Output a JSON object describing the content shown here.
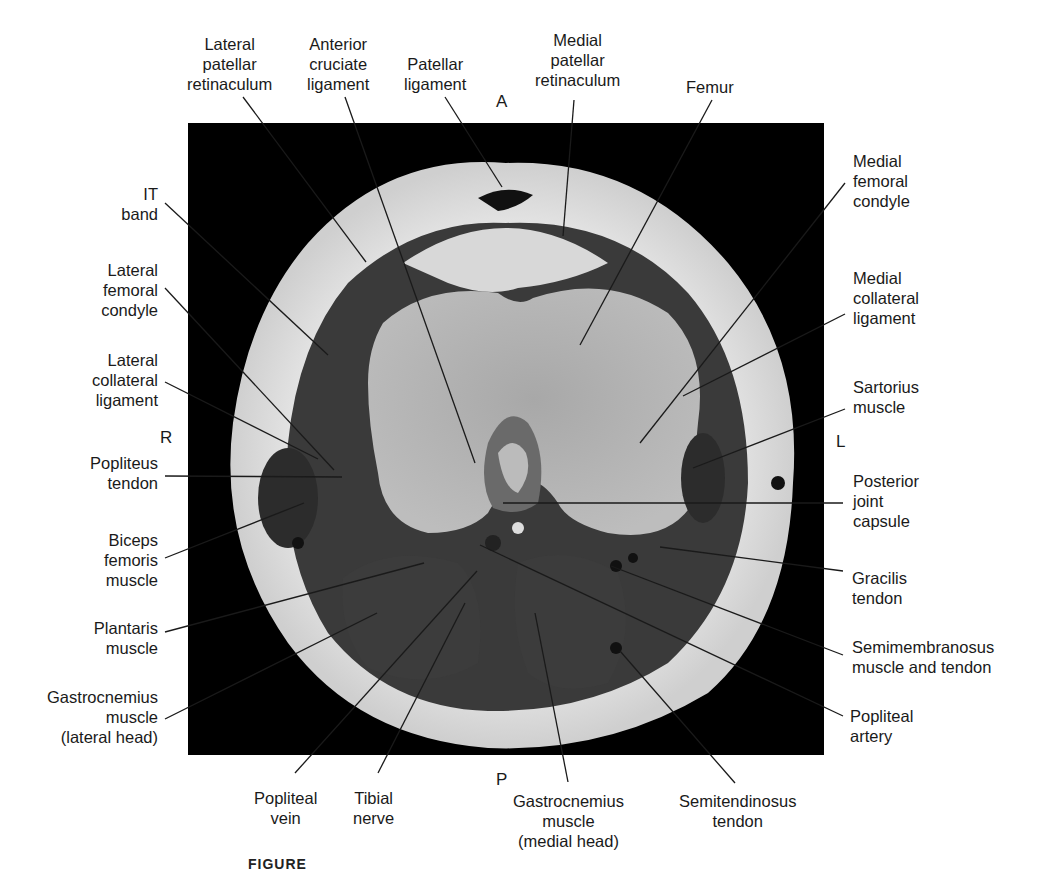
{
  "figure": {
    "caption_fragment": "FIGURE",
    "image": "Axial T1-weighted MRI of the knee"
  },
  "orientation": {
    "anterior": "A",
    "posterior": "P",
    "right": "R",
    "left": "L"
  },
  "labels": {
    "lateral_patellar_retinaculum": "Lateral\npatellar\nretinaculum",
    "anterior_cruciate_ligament": "Anterior\ncruciate\nligament",
    "patellar_ligament": "Patellar\nligament",
    "medial_patellar_retinaculum": "Medial\npatellar\nretinaculum",
    "femur": "Femur",
    "medial_femoral_condyle": "Medial\nfemoral\ncondyle",
    "medial_collateral_ligament": "Medial\ncollateral\nligament",
    "sartorius_muscle": "Sartorius\nmuscle",
    "posterior_joint_capsule": "Posterior\njoint\ncapsule",
    "gracilis_tendon": "Gracilis\ntendon",
    "semimembranosus": "Semimembranosus\nmuscle and tendon",
    "popliteal_artery": "Popliteal\nartery",
    "it_band": "IT\nband",
    "lateral_femoral_condyle": "Lateral\nfemoral\ncondyle",
    "lateral_collateral_ligament": "Lateral\ncollateral\nligament",
    "popliteus_tendon": "Popliteus\ntendon",
    "biceps_femoris_muscle": "Biceps\nfemoris\nmuscle",
    "plantaris_muscle": "Plantaris\nmuscle",
    "gastrocnemius_lateral": "Gastrocnemius\nmuscle\n(lateral head)",
    "popliteal_vein": "Popliteal\nvein",
    "tibial_nerve": "Tibial\nnerve",
    "gastrocnemius_medial": "Gastrocnemius\nmuscle\n(medial head)",
    "semitendinosus_tendon": "Semitendinosus\ntendon"
  }
}
